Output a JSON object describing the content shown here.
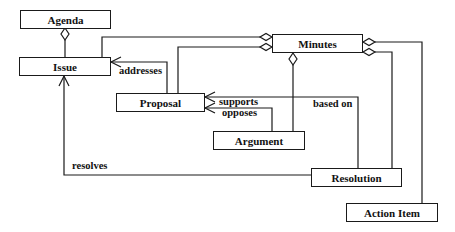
{
  "diagram": {
    "type": "UML class diagram",
    "classes": [
      {
        "id": "agenda",
        "name": "Agenda"
      },
      {
        "id": "issue",
        "name": "Issue"
      },
      {
        "id": "minutes",
        "name": "Minutes"
      },
      {
        "id": "proposal",
        "name": "Proposal"
      },
      {
        "id": "argument",
        "name": "Argument"
      },
      {
        "id": "resolution",
        "name": "Resolution"
      },
      {
        "id": "action_item",
        "name": "Action Item"
      }
    ],
    "relations": [
      {
        "from": "Agenda",
        "to": "Issue",
        "kind": "aggregation",
        "label": ""
      },
      {
        "from": "Minutes",
        "to": "Issue",
        "kind": "aggregation",
        "label": ""
      },
      {
        "from": "Minutes",
        "to": "Proposal",
        "kind": "aggregation",
        "label": ""
      },
      {
        "from": "Minutes",
        "to": "Argument",
        "kind": "aggregation",
        "label": ""
      },
      {
        "from": "Minutes",
        "to": "Resolution",
        "kind": "aggregation",
        "label": ""
      },
      {
        "from": "Minutes",
        "to": "Action Item",
        "kind": "aggregation",
        "label": ""
      },
      {
        "from": "Proposal",
        "to": "Issue",
        "kind": "association",
        "label": "addresses"
      },
      {
        "from": "Argument",
        "to": "Proposal",
        "kind": "association",
        "label": "supports"
      },
      {
        "from": "Argument",
        "to": "Proposal",
        "kind": "association",
        "label": "opposes"
      },
      {
        "from": "Resolution",
        "to": "Proposal",
        "kind": "association",
        "label": "based on"
      },
      {
        "from": "Resolution",
        "to": "Issue",
        "kind": "association",
        "label": "resolves"
      }
    ]
  },
  "labels": {
    "agenda": "Agenda",
    "issue": "Issue",
    "minutes": "Minutes",
    "proposal": "Proposal",
    "argument": "Argument",
    "resolution": "Resolution",
    "action_item": "Action Item",
    "addresses": "addresses",
    "supports": "supports",
    "opposes": "opposes",
    "based_on": "based on",
    "resolves": "resolves"
  },
  "colors": {
    "line": "#1a1a1a",
    "background": "#ffffff"
  }
}
